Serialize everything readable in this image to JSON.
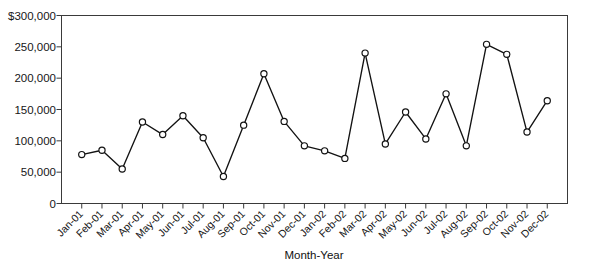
{
  "chart_data": {
    "type": "line",
    "title": "",
    "xlabel": "Month-Year",
    "ylabel": "",
    "categories": [
      "Jan-01",
      "Feb-01",
      "Mar-01",
      "Apr-01",
      "May-01",
      "Jun-01",
      "Jul-01",
      "Aug-01",
      "Sep-01",
      "Oct-01",
      "Nov-01",
      "Dec-01",
      "Jan-02",
      "Feb-02",
      "Mar-02",
      "Apr-02",
      "May-02",
      "Jun-02",
      "Jul-02",
      "Aug-02",
      "Sep-02",
      "Oct-02",
      "Nov-02",
      "Dec-02"
    ],
    "values": [
      78000,
      85000,
      55000,
      130000,
      110000,
      140000,
      105000,
      43000,
      125000,
      207000,
      131000,
      92000,
      84000,
      72000,
      240000,
      95000,
      146000,
      103000,
      175000,
      92000,
      254000,
      238000,
      114000,
      164000
    ],
    "ylim": [
      0,
      300000
    ],
    "yticks": [
      0,
      50000,
      100000,
      150000,
      200000,
      250000,
      300000
    ],
    "ytick_labels": [
      "0",
      "50,000",
      "100,000",
      "150,000",
      "200,000",
      "250,000",
      "$300,000"
    ],
    "grid": false,
    "legend": false,
    "marker": "open-circle",
    "line_color": "#121212",
    "marker_fill": "#ffffff"
  },
  "figure": {
    "background_color": "#ffffff",
    "axis_color": "#3a3a3a",
    "clipped_title_text": ""
  }
}
